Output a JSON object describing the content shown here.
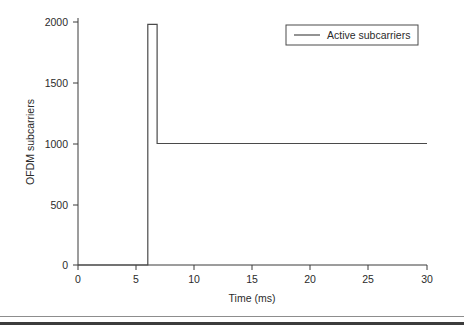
{
  "chart_data": {
    "type": "line",
    "title": "",
    "xlabel": "Time (ms)",
    "ylabel": "OFDM subcarriers",
    "xlim": [
      0,
      30
    ],
    "ylim": [
      0,
      2000
    ],
    "xticks": [
      0,
      5,
      10,
      15,
      20,
      25,
      30
    ],
    "xticklabels": [
      "0",
      "5",
      "10",
      "15",
      "20",
      "25",
      "30"
    ],
    "yticks": [
      0,
      500,
      1000,
      1500,
      2000
    ],
    "yticklabels": [
      "0",
      "500",
      "1000",
      "1500",
      "2000"
    ],
    "grid": false,
    "legend": {
      "position": "upper right",
      "entries": [
        "Active subcarriers"
      ]
    },
    "series": [
      {
        "name": "Active subcarriers",
        "color": "#4a4a4a",
        "style": "step",
        "x": [
          0,
          6.0,
          6.0,
          6.8,
          6.8,
          30
        ],
        "y": [
          0,
          0,
          1980,
          1980,
          1000,
          1000
        ]
      }
    ],
    "annotations": []
  },
  "axes": {
    "y_title": "OFDM subcarriers",
    "x_title": "Time (ms)",
    "y_labels": [
      "2000",
      "1500",
      "1000",
      "500",
      "0"
    ],
    "x_labels": [
      "0",
      "5",
      "10",
      "15",
      "20",
      "25",
      "30"
    ]
  },
  "legend": {
    "label": "Active subcarriers"
  }
}
